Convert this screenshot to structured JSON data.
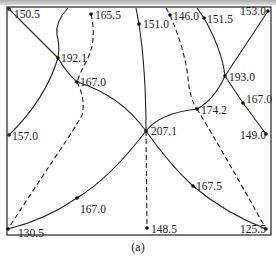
{
  "caption_strip": "",
  "figure": {
    "label": "(a)",
    "frame": {
      "x": 7,
      "y": 7,
      "width": 264,
      "height": 228
    },
    "nodes": [
      {
        "id": "n1",
        "value": "150.5",
        "x": 9,
        "y": 9,
        "lx": 14,
        "ly": 18
      },
      {
        "id": "n2",
        "value": "165.5",
        "x": 91,
        "y": 14,
        "lx": 95,
        "ly": 19
      },
      {
        "id": "n3",
        "value": "151.0",
        "x": 139,
        "y": 24,
        "lx": 143,
        "ly": 28
      },
      {
        "id": "n4",
        "value": "146.0",
        "x": 170,
        "y": 15,
        "lx": 173,
        "ly": 20
      },
      {
        "id": "n5",
        "value": "151.5",
        "x": 204,
        "y": 18,
        "lx": 207,
        "ly": 23
      },
      {
        "id": "n6",
        "value": "153.0",
        "x": 268,
        "y": 11,
        "lx": 240,
        "ly": 15
      },
      {
        "id": "n7",
        "value": "192.1",
        "x": 58,
        "y": 58,
        "lx": 61,
        "ly": 62
      },
      {
        "id": "n8",
        "value": "167.0",
        "x": 77,
        "y": 82,
        "lx": 80,
        "ly": 86
      },
      {
        "id": "n9",
        "value": "193.0",
        "x": 225,
        "y": 76,
        "lx": 229,
        "ly": 81
      },
      {
        "id": "n10",
        "value": "167.0",
        "x": 243,
        "y": 103,
        "lx": 246,
        "ly": 103
      },
      {
        "id": "n11",
        "value": "174.2",
        "x": 197,
        "y": 109,
        "lx": 201,
        "ly": 114
      },
      {
        "id": "n12",
        "value": "157.0",
        "x": 9,
        "y": 135,
        "lx": 12,
        "ly": 140
      },
      {
        "id": "n13",
        "value": "207.1",
        "x": 146,
        "y": 131,
        "lx": 151,
        "ly": 135
      },
      {
        "id": "n14",
        "value": "149.0",
        "x": 266,
        "y": 134,
        "lx": 240,
        "ly": 139
      },
      {
        "id": "n15",
        "value": "167.0",
        "x": 77,
        "y": 198,
        "lx": 80,
        "ly": 213
      },
      {
        "id": "n16",
        "value": "167.5",
        "x": 193,
        "y": 186,
        "lx": 196,
        "ly": 190
      },
      {
        "id": "n17",
        "value": "130.5",
        "x": 8,
        "y": 229,
        "lx": 18,
        "ly": 237
      },
      {
        "id": "n18",
        "value": "148.5",
        "x": 147,
        "y": 228,
        "lx": 151,
        "ly": 233
      },
      {
        "id": "n19",
        "value": "125.5",
        "x": 266,
        "y": 229,
        "lx": 240,
        "ly": 233
      }
    ]
  }
}
